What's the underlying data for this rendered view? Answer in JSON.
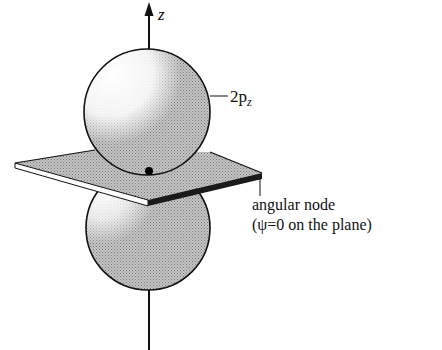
{
  "figure": {
    "axis_label": "z",
    "orbital_label": "2p",
    "orbital_subscript": "z",
    "node_label_line1": "angular node",
    "node_label_line2": "(ψ=0 on the plane)",
    "colors": {
      "ink": "#111111",
      "shade": "#b8b8b8",
      "highlight": "#ffffff",
      "plane_edge_dark": "#1a1a1a",
      "plane_edge_light": "#ffffff"
    }
  }
}
